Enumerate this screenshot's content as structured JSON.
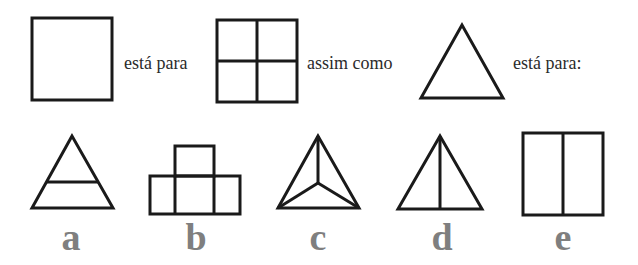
{
  "prompt": {
    "phrase_1": "está para",
    "phrase_2": "assim como",
    "phrase_3": "está para:"
  },
  "premise_shapes": [
    {
      "id": "square",
      "description": "empty square"
    },
    {
      "id": "square-quartered",
      "description": "square divided into four cells"
    },
    {
      "id": "triangle",
      "description": "empty triangle"
    }
  ],
  "options": [
    {
      "label": "a",
      "description": "triangle with horizontal line across"
    },
    {
      "label": "b",
      "description": "three squares in a row with one square on top of the middle"
    },
    {
      "label": "c",
      "description": "triangle with lines from each vertex to the center"
    },
    {
      "label": "d",
      "description": "triangle with vertical line from apex to base"
    },
    {
      "label": "e",
      "description": "rectangle divided by vertical line into two halves"
    }
  ],
  "colors": {
    "stroke": "#1a1a1a",
    "text": "#2b2b2b",
    "option_label": "#7f7f7f",
    "background": "#ffffff"
  }
}
